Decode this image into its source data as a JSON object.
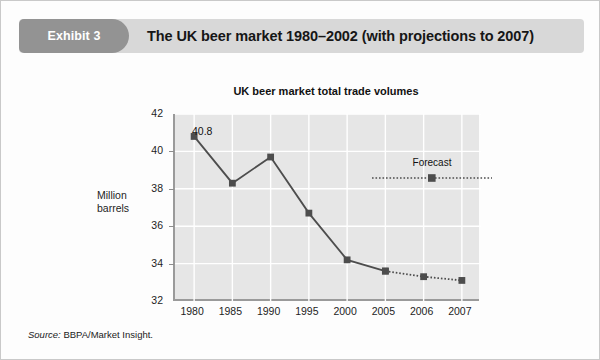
{
  "exhibit": {
    "tab_label": "Exhibit 3",
    "title": "The UK beer market 1980–2002 (with projections to 2007)"
  },
  "source": {
    "prefix": "Source:",
    "text": "BBPA/Market Insight."
  },
  "colors": {
    "tab_background": "#939393",
    "header_background": "#d8d8d8",
    "plot_background": "#e6e6e6",
    "gridline": "#ffffff",
    "series_line": "#4d4d4d",
    "marker": "#4d4d4d",
    "axis": "#9a9a9a"
  },
  "chart_data": {
    "type": "line",
    "title": "UK beer market total trade volumes",
    "xlabel": "",
    "ylabel": "Million barrels",
    "categories": [
      "1980",
      "1985",
      "1990",
      "1995",
      "2000",
      "2005",
      "2006",
      "2007"
    ],
    "values": [
      40.8,
      38.3,
      39.7,
      36.7,
      34.2,
      33.6,
      33.3,
      33.1
    ],
    "ylim": [
      32,
      42
    ],
    "yticks": [
      32,
      34,
      36,
      38,
      40,
      42
    ],
    "ytick_labels": [
      "32",
      "34",
      "36",
      "38",
      "40",
      "42"
    ],
    "grid": true,
    "gridlines": "horizontal-and-vertical",
    "legend": {
      "position": "inside-top-right",
      "entries": [
        {
          "name": "Forecast",
          "linestyle": "dotted",
          "marker": "square"
        }
      ]
    },
    "annotations": [
      {
        "text": "40.8",
        "x": "1980",
        "y": 40.8
      }
    ],
    "series": [
      {
        "name": "Actual",
        "linestyle": "solid",
        "marker": "square",
        "x": [
          "1980",
          "1985",
          "1990",
          "1995",
          "2000",
          "2005"
        ],
        "values": [
          40.8,
          38.3,
          39.7,
          36.7,
          34.2,
          33.6
        ]
      },
      {
        "name": "Forecast",
        "linestyle": "dotted",
        "marker": "square",
        "x": [
          "2005",
          "2006",
          "2007"
        ],
        "values": [
          33.6,
          33.3,
          33.1
        ]
      }
    ]
  }
}
